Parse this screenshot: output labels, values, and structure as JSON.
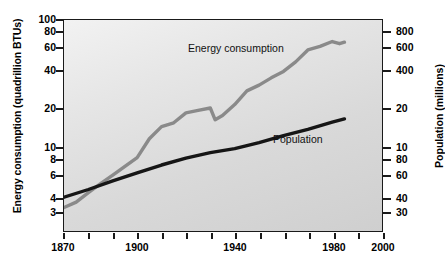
{
  "chart_data": {
    "type": "line",
    "title": "",
    "subtitle": "",
    "xlabel": "",
    "ylabel": "Energy consumption (quadrillion BTUs)",
    "y2label": "Population (millions)",
    "xlim": [
      1870,
      2000
    ],
    "x_ticks_major": [
      1870,
      1900,
      1940,
      1980,
      2000
    ],
    "x_ticks_minor_interval": 10,
    "y_scale": "log",
    "y_ticks": [
      3,
      4,
      6,
      8,
      10,
      20,
      40,
      60,
      80,
      100
    ],
    "ylim": [
      2.6,
      115
    ],
    "y2_scale": "log",
    "y2_ticks": [
      30,
      40,
      60,
      80,
      10,
      20,
      400,
      600,
      800
    ],
    "grid": false,
    "legend_position": "inline-annotations",
    "series": [
      {
        "name": "Energy consumption",
        "color": "#8a8a8a",
        "units": "quadrillion BTUs",
        "axis": "left",
        "x": [
          1870,
          1875,
          1880,
          1885,
          1890,
          1895,
          1900,
          1905,
          1910,
          1915,
          1920,
          1925,
          1930,
          1932,
          1935,
          1940,
          1945,
          1950,
          1955,
          1960,
          1965,
          1970,
          1975,
          1980,
          1983,
          1985
        ],
        "values": [
          3.9,
          4.3,
          5.1,
          6.0,
          7.0,
          8.2,
          9.6,
          13.5,
          16.8,
          18.0,
          21.5,
          22.5,
          23.5,
          19.0,
          20.5,
          25.0,
          32.0,
          35.5,
          40.5,
          45.5,
          54.0,
          67.0,
          71.5,
          78.0,
          75.0,
          77.0
        ]
      },
      {
        "name": "Population",
        "color": "#161616",
        "units": "millions",
        "axis": "right",
        "x": [
          1870,
          1880,
          1890,
          1900,
          1910,
          1920,
          1930,
          1940,
          1950,
          1960,
          1970,
          1980,
          1985
        ],
        "values": [
          4.7,
          5.4,
          6.3,
          7.3,
          8.4,
          9.5,
          10.5,
          11.3,
          12.6,
          14.3,
          16.0,
          18.2,
          19.3
        ]
      }
    ],
    "annotations": [
      {
        "text": "Energy consumption",
        "x": 1930,
        "y": 60
      },
      {
        "text": "Population",
        "x": 1955,
        "y": 13
      }
    ]
  },
  "axes": {
    "left": {
      "title": "Energy consumption (quadrillion BTUs)",
      "ticks": [
        {
          "label": "100",
          "y": 19
        },
        {
          "label": "80",
          "y": 31
        },
        {
          "label": "60",
          "y": 47
        },
        {
          "label": "40",
          "y": 70
        },
        {
          "label": "20",
          "y": 108
        },
        {
          "label": "10",
          "y": 147
        },
        {
          "label": "8",
          "y": 159
        },
        {
          "label": "6",
          "y": 175
        },
        {
          "label": "4",
          "y": 198
        },
        {
          "label": "3",
          "y": 212
        }
      ]
    },
    "right": {
      "title": "Population (millions)",
      "ticks": [
        {
          "label": "800",
          "y": 31
        },
        {
          "label": "600",
          "y": 47
        },
        {
          "label": "400",
          "y": 70
        },
        {
          "label": "20",
          "y": 108
        },
        {
          "label": "10",
          "y": 147
        },
        {
          "label": "80",
          "y": 159
        },
        {
          "label": "60",
          "y": 175
        },
        {
          "label": "40",
          "y": 198
        },
        {
          "label": "30",
          "y": 212
        }
      ]
    },
    "bottom": {
      "ticks": [
        {
          "label": "1870",
          "x": 63
        },
        {
          "label": "1900",
          "x": 137
        },
        {
          "label": "1940",
          "x": 235
        },
        {
          "label": "1980",
          "x": 334
        },
        {
          "label": "2000",
          "x": 383
        }
      ],
      "minor_ticks_x": [
        63,
        88,
        113,
        137,
        162,
        186,
        211,
        235,
        260,
        285,
        309,
        334,
        358,
        383
      ]
    }
  },
  "labels": {
    "energy": "Energy consumption",
    "population": "Population"
  }
}
